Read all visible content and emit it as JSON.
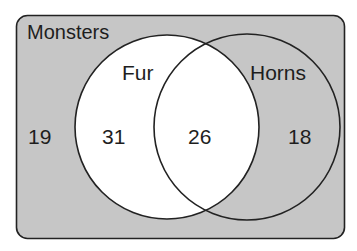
{
  "diagram": {
    "type": "venn",
    "universe": {
      "label": "Monsters",
      "outside_count": "19"
    },
    "sets": [
      {
        "label": "Fur",
        "only_count": "31"
      },
      {
        "label": "Horns",
        "only_count": "18"
      }
    ],
    "intersection_count": "26",
    "colors": {
      "background_fill": "#c6c6c6",
      "fur_fill": "#ffffff",
      "horns_fill": "#c6c6c6",
      "stroke": "#222222",
      "text": "#1e1e1e"
    }
  }
}
